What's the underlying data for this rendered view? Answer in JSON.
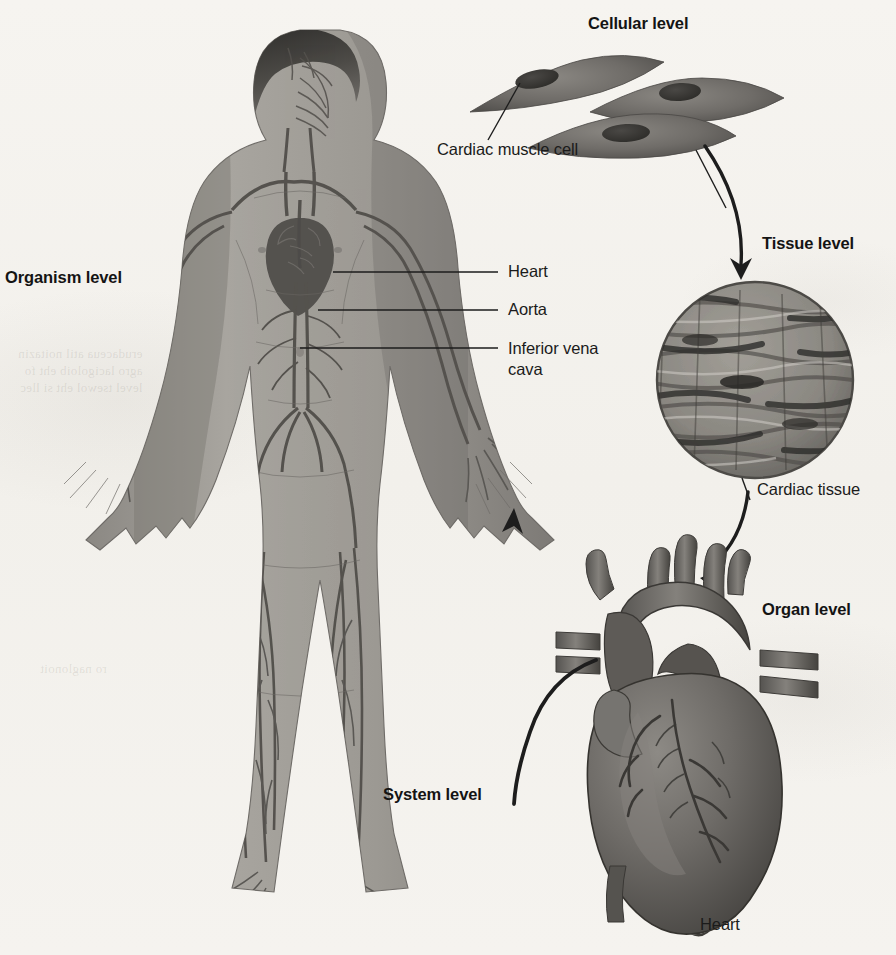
{
  "figure": {
    "background_color": "#f4f2ee",
    "ink_color": "#1d1d1d"
  },
  "levels": [
    {
      "id": "organism",
      "label": "Organism level",
      "x": 5,
      "y": 268
    },
    {
      "id": "cellular",
      "label": "Cellular level",
      "x": 588,
      "y": 14
    },
    {
      "id": "tissue",
      "label": "Tissue level",
      "x": 762,
      "y": 234
    },
    {
      "id": "organ",
      "label": "Organ level",
      "x": 762,
      "y": 600
    },
    {
      "id": "system",
      "label": "System level",
      "x": 383,
      "y": 785
    }
  ],
  "captions": [
    {
      "id": "cardiac-muscle-cell",
      "text": "Cardiac muscle cell",
      "x": 437,
      "y": 140
    },
    {
      "id": "cardiac-tissue",
      "text": "Cardiac tissue",
      "x": 757,
      "y": 480
    },
    {
      "id": "heart-organ",
      "text": "Heart",
      "x": 700,
      "y": 915
    }
  ],
  "anatomy_labels": [
    {
      "id": "heart",
      "text": "Heart",
      "x": 508,
      "y": 262,
      "leader_from_x": 333,
      "leader_from_y": 272,
      "leader_to_x": 498,
      "leader_to_y": 272
    },
    {
      "id": "aorta",
      "text": "Aorta",
      "x": 508,
      "y": 300,
      "leader_from_x": 318,
      "leader_from_y": 310,
      "leader_to_x": 498,
      "leader_to_y": 310
    },
    {
      "id": "inferior-vena-cava",
      "text": "Inferior vena cava",
      "x": 508,
      "y": 338,
      "leader_from_x": 300,
      "leader_from_y": 348,
      "leader_to_x": 498,
      "leader_to_y": 348
    }
  ],
  "arrows": [
    {
      "id": "cells-to-tissue",
      "from": "cellular",
      "to": "tissue",
      "direction": "down"
    },
    {
      "id": "tissue-to-organ",
      "from": "tissue",
      "to": "organ",
      "direction": "down-left"
    },
    {
      "id": "organ-to-organism",
      "from": "organ",
      "to": "system",
      "direction": "up-left"
    }
  ],
  "organism": {
    "description": "Anterior view of a male human figure with the cardiovascular system overlaid",
    "skin_color": "#9d9a94",
    "vessel_color": "#5d5b58"
  },
  "cells": {
    "count": 3,
    "description": "Three spindle-shaped cardiac muscle cells, each with a central dark nucleus",
    "fill_color": "#6e6c68",
    "nucleus_color": "#3a3936"
  },
  "tissue": {
    "shape": "circle",
    "description": "Circular micrograph of striated cardiac muscle tissue with branching fibers",
    "fill_color": "#8d8a84"
  },
  "organ": {
    "description": "Anterior view of the human heart with great vessels and coronary arteries",
    "fill_color": "#6b6864"
  }
}
